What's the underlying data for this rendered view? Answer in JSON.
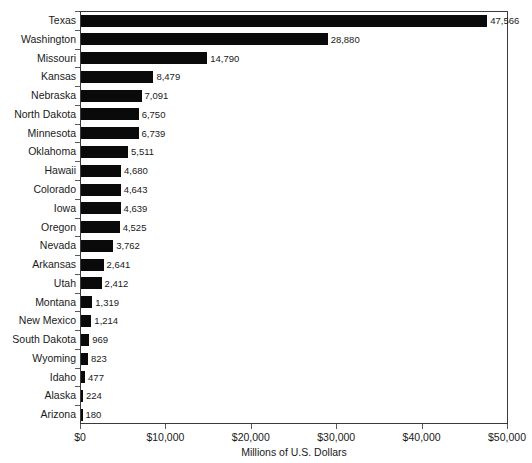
{
  "chart_data": {
    "type": "bar",
    "orientation": "horizontal",
    "title": "",
    "xlabel": "Millions of U.S. Dollars",
    "ylabel": "",
    "xlim": [
      0,
      50000
    ],
    "xticks": [
      0,
      10000,
      20000,
      30000,
      40000,
      50000
    ],
    "xtick_labels": [
      "$0",
      "$10,000",
      "$20,000",
      "$30,000",
      "$40,000",
      "$50,000"
    ],
    "grid": false,
    "legend": null,
    "categories": [
      "Texas",
      "Washington",
      "Missouri",
      "Kansas",
      "Nebraska",
      "North Dakota",
      "Minnesota",
      "Oklahoma",
      "Hawaii",
      "Colorado",
      "Iowa",
      "Oregon",
      "Nevada",
      "Arkansas",
      "Utah",
      "Montana",
      "New Mexico",
      "South Dakota",
      "Wyoming",
      "Idaho",
      "Alaska",
      "Arizona"
    ],
    "values": [
      47566,
      28880,
      14790,
      8479,
      7091,
      6750,
      6739,
      5511,
      4680,
      4643,
      4639,
      4525,
      3762,
      2641,
      2412,
      1319,
      1214,
      969,
      823,
      477,
      224,
      180
    ],
    "value_labels": [
      "47,566",
      "28,880",
      "14,790",
      "8,479",
      "7,091",
      "6,750",
      "6,739",
      "5,511",
      "4,680",
      "4,643",
      "4,639",
      "4,525",
      "3,762",
      "2,641",
      "2,412",
      "1,319",
      "1,214",
      "969",
      "823",
      "477",
      "224",
      "180"
    ],
    "bar_color": "#0a0a0a",
    "axis_color": "#3a3a3a",
    "background": "#ffffff"
  }
}
